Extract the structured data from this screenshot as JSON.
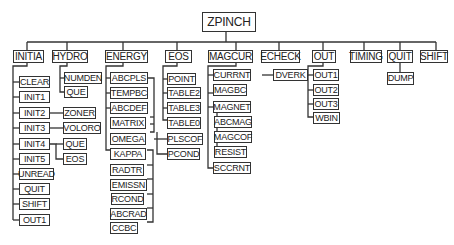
{
  "diagram": {
    "type": "call-tree",
    "root": "ZPINCH",
    "modules": [
      {
        "name": "INITIA",
        "children": [
          "CLEAR",
          "INIT1",
          "INIT2",
          "INIT3",
          "INIT4",
          "INIT5",
          "UNREAD",
          "QUIT",
          "SHIFT",
          "OUT1"
        ],
        "sub": {
          "INIT2": [
            "ZONER"
          ],
          "INIT3": [
            "VOLORO"
          ],
          "INIT4": [
            "QUE",
            "EOS"
          ]
        }
      },
      {
        "name": "HYDRO",
        "children": [
          "NUMDEN",
          "QUE"
        ]
      },
      {
        "name": "ENERGY",
        "children": [
          "ABCPLS",
          "TEMPBC",
          "ABCDEF",
          "MATRIX",
          "OMEGA",
          "KAPPA",
          "RADTR",
          "EMISSN",
          "RCOND",
          "ABCRAD",
          "CCBC"
        ]
      },
      {
        "name": "EOS",
        "children": [
          "POINT",
          "TABLE2",
          "TABLE3",
          "TABLE0",
          "PLSCOF",
          "PCOND"
        ]
      },
      {
        "name": "MAGCUR",
        "children": [
          "CURRNT",
          "MAGBC",
          "MAGNET",
          "ABCMAG",
          "MAGCOF",
          "RESIST",
          "SCCRNT"
        ],
        "sub": {
          "CURRNT": [
            "DVERK"
          ]
        }
      },
      {
        "name": "ECHECK",
        "children": []
      },
      {
        "name": "OUT",
        "children": [
          "OUT1",
          "OUT2",
          "OUT3",
          "WBIN"
        ]
      },
      {
        "name": "TIMING",
        "children": []
      },
      {
        "name": "QUIT",
        "children": [
          "DUMP"
        ]
      },
      {
        "name": "SHIFT",
        "children": []
      }
    ]
  },
  "labels": {
    "root": "ZPINCH",
    "initia": "INITIA",
    "hydro": "HYDRO",
    "energy": "ENERGY",
    "eos": "EOS",
    "magcur": "MAGCUR",
    "echeck": "ECHECK",
    "out": "OUT",
    "timing": "TIMING",
    "quit": "QUIT",
    "shift": "SHIFT",
    "initia_children": [
      "CLEAR",
      "INIT1",
      "INIT2",
      "INIT3",
      "INIT4",
      "INIT5",
      "UNREAD",
      "QUIT",
      "SHIFT",
      "OUT1"
    ],
    "init_sub": {
      "zoner": "ZONER",
      "voloro": "VOLORO",
      "que": "QUE",
      "eos": "EOS"
    },
    "hydro_children": [
      "NUMDEN",
      "QUE"
    ],
    "energy_children": [
      "ABCPLS",
      "TEMPBC",
      "ABCDEF",
      "MATRIX",
      "OMEGA",
      "KAPPA",
      "RADTR",
      "EMISSN",
      "RCOND",
      "ABCRAD",
      "CCBC"
    ],
    "eos_children": [
      "POINT",
      "TABLE2",
      "TABLE3",
      "TABLE0",
      "PLSCOF",
      "PCOND"
    ],
    "magcur_children": [
      "CURRNT",
      "MAGBC",
      "MAGNET",
      "ABCMAG",
      "MAGCOF",
      "RESIST",
      "SCCRNT"
    ],
    "dverk": "DVERK",
    "out_children": [
      "OUT1",
      "OUT2",
      "OUT3",
      "WBIN"
    ],
    "dump": "DUMP"
  }
}
